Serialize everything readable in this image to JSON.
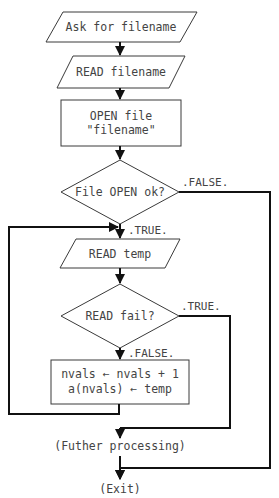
{
  "diagram": {
    "type": "flowchart",
    "colors": {
      "background": "#ffffff",
      "shape_stroke": "#3a3a3a",
      "line": "#111111",
      "text": "#444444"
    },
    "nodes": [
      {
        "id": "ask",
        "shape": "parallelogram",
        "label": "Ask for filename"
      },
      {
        "id": "read_filename",
        "shape": "parallelogram",
        "label": "READ filename"
      },
      {
        "id": "open_file",
        "shape": "rectangle",
        "lines": [
          "OPEN file",
          "\"filename\""
        ]
      },
      {
        "id": "open_ok",
        "shape": "diamond",
        "label": "File OPEN ok?"
      },
      {
        "id": "read_temp",
        "shape": "parallelogram",
        "label": "READ temp"
      },
      {
        "id": "read_fail",
        "shape": "diamond",
        "label": "READ fail?"
      },
      {
        "id": "store",
        "shape": "rectangle",
        "lines": [
          "nvals ← nvals + 1",
          "a(nvals) ← temp"
        ]
      },
      {
        "id": "further",
        "shape": "terminal-text",
        "label": "(Futher processing)"
      },
      {
        "id": "exit",
        "shape": "terminal-text",
        "label": "(Exit)"
      }
    ],
    "edges": [
      {
        "from": "ask",
        "to": "read_filename",
        "label": ""
      },
      {
        "from": "read_filename",
        "to": "open_file",
        "label": ""
      },
      {
        "from": "open_file",
        "to": "open_ok",
        "label": ""
      },
      {
        "from": "open_ok",
        "to": "read_temp",
        "label": ".TRUE."
      },
      {
        "from": "open_ok",
        "to": "exit",
        "label": ".FALSE."
      },
      {
        "from": "read_temp",
        "to": "read_fail",
        "label": ""
      },
      {
        "from": "read_fail",
        "to": "store",
        "label": ".FALSE."
      },
      {
        "from": "read_fail",
        "to": "further",
        "label": ".TRUE."
      },
      {
        "from": "store",
        "to": "read_temp",
        "label": "loop"
      },
      {
        "from": "further",
        "to": "exit",
        "label": ""
      }
    ]
  }
}
